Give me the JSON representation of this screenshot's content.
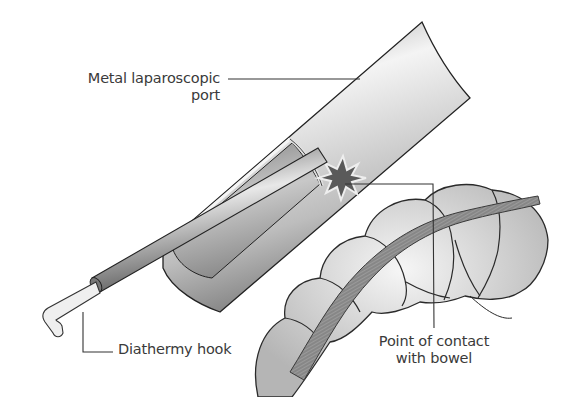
{
  "figure": {
    "type": "medical-illustration",
    "labels": {
      "port": {
        "line1": "Metal laparoscopic",
        "line2": "port"
      },
      "hook": {
        "text": "Diathermy hook"
      },
      "contact": {
        "line1": "Point of contact",
        "line2": "with bowel"
      }
    },
    "colors": {
      "ink": "#2a2a2a",
      "label_text": "#3a3a3a",
      "metal_light": "#f2f2f2",
      "metal_mid": "#b8b8b8",
      "metal_dark": "#6e6e6e",
      "spark": "#555555",
      "bowel_light": "#eeeeee",
      "bowel_mid": "#c9c9c9"
    }
  }
}
